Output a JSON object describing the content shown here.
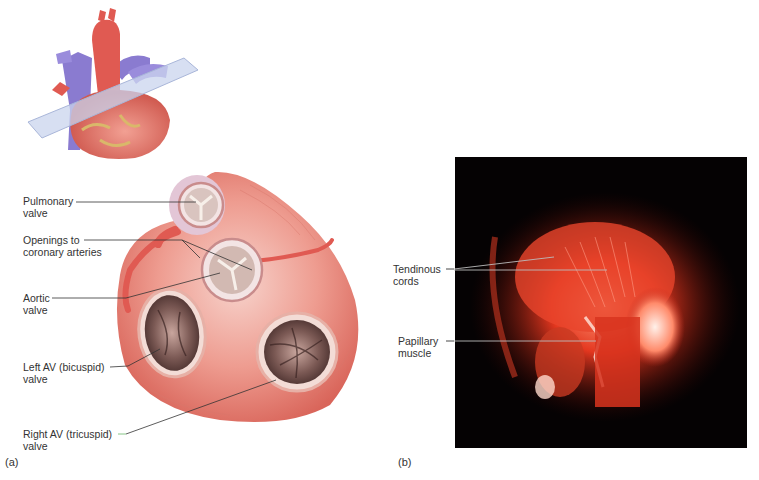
{
  "figure": {
    "panel_a": {
      "letter": "(a)",
      "inset_description": "Heart with transverse cutting plane",
      "labels": [
        {
          "line1": "Pulmonary",
          "line2": "valve"
        },
        {
          "line1": "Openings to",
          "line2": "coronary arteries"
        },
        {
          "line1": "Aortic",
          "line2": "valve"
        },
        {
          "line1": "Left AV (bicuspid)",
          "line2": "valve"
        },
        {
          "line1": "Right AV (tricuspid)",
          "line2": "valve"
        }
      ]
    },
    "panel_b": {
      "letter": "(b)",
      "labels": [
        {
          "line1": "Tendinous",
          "line2": "cords"
        },
        {
          "line1": "Papillary",
          "line2": "muscle"
        }
      ]
    },
    "colors": {
      "myocardium": "#e8837a",
      "myocardium_light": "#f3b7ad",
      "artery": "#e05a52",
      "vein": "#8a7bd0",
      "plane": "#c9d4ee",
      "photo_bg": "#050203",
      "photo_red": "#e4371f"
    }
  }
}
